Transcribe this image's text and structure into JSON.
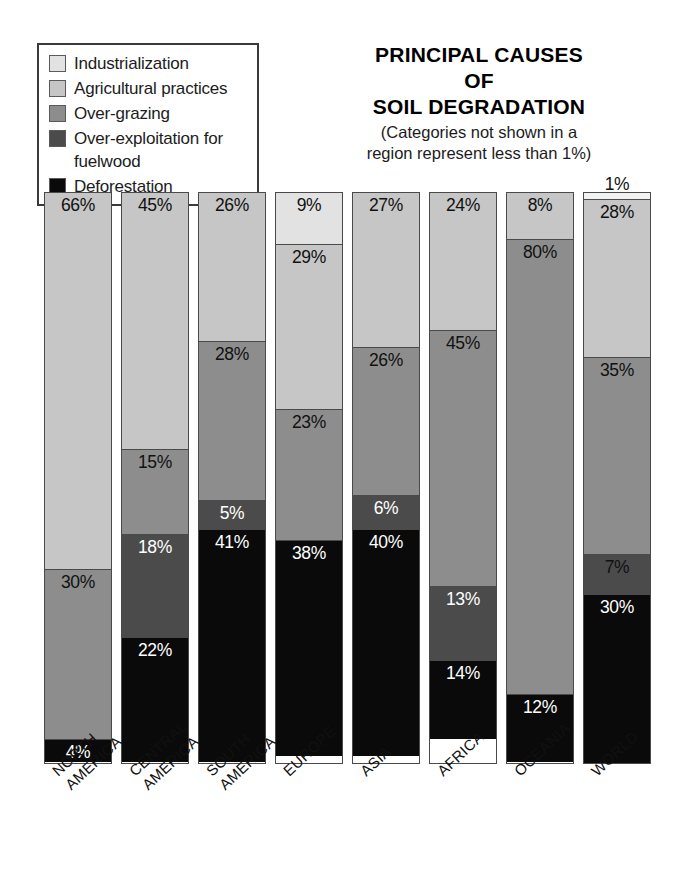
{
  "title": {
    "line1": "PRINCIPAL CAUSES",
    "line2": "OF",
    "line3": "SOIL DEGRADATION",
    "note_line1": "(Categories not shown in a",
    "note_line2": "region represent less than 1%)"
  },
  "legend": {
    "items": [
      {
        "label": "Industrialization",
        "color": "#e2e2e2"
      },
      {
        "label": "Agricultural practices",
        "color": "#c6c6c6"
      },
      {
        "label": "Over-grazing",
        "color": "#8d8d8d"
      },
      {
        "label": "Over-exploitation for\nfuelwood",
        "color": "#4b4b4b"
      },
      {
        "label": "Deforestation",
        "color": "#0a0a0a"
      }
    ]
  },
  "chart_data": {
    "type": "bar",
    "subtype": "stacked-100-percent",
    "title": "PRINCIPAL CAUSES OF SOIL DEGRADATION",
    "subtitle": "(Categories not shown in a region represent less than 1%)",
    "xlabel": "",
    "ylabel": "",
    "ylim": [
      0,
      100
    ],
    "unit": "%",
    "grid": false,
    "legend_position": "top-left",
    "categories": [
      "NORTH\nAMERICA",
      "CENTRAL\nAMERICA",
      "SOUTH\nAMERICA",
      "EUROPE",
      "ASIA",
      "AFRICA",
      "OCEANIA",
      "WORLD"
    ],
    "series": [
      {
        "name": "Industrialization",
        "color": "#e2e2e2",
        "values": [
          0,
          0,
          0,
          9,
          0,
          0,
          0,
          1
        ]
      },
      {
        "name": "Agricultural practices",
        "color": "#c6c6c6",
        "values": [
          66,
          45,
          26,
          29,
          27,
          24,
          8,
          28
        ]
      },
      {
        "name": "Over-grazing",
        "color": "#8d8d8d",
        "values": [
          30,
          15,
          28,
          23,
          26,
          45,
          80,
          35
        ]
      },
      {
        "name": "Over-exploitation for fuelwood",
        "color": "#4b4b4b",
        "values": [
          0,
          18,
          5,
          0,
          6,
          13,
          0,
          7
        ]
      },
      {
        "name": "Deforestation",
        "color": "#0a0a0a",
        "values": [
          4,
          22,
          41,
          38,
          40,
          14,
          12,
          30
        ]
      }
    ]
  },
  "bars": [
    {
      "region": "NORTH AMERICA",
      "label_line1": "NORTH",
      "label_line2": "AMERICA",
      "segments": [
        {
          "cause": "Agricultural practices",
          "value": 66,
          "text": "66%",
          "color": "#c6c6c6",
          "text_color": "dark"
        },
        {
          "cause": "Over-grazing",
          "value": 30,
          "text": "30%",
          "color": "#8d8d8d",
          "text_color": "dark"
        },
        {
          "cause": "Deforestation",
          "value": 4,
          "text": "4%",
          "color": "#0a0a0a",
          "text_color": "light"
        }
      ]
    },
    {
      "region": "CENTRAL AMERICA",
      "label_line1": "CENTRAL",
      "label_line2": "AMERICA",
      "segments": [
        {
          "cause": "Agricultural practices",
          "value": 45,
          "text": "45%",
          "color": "#c6c6c6",
          "text_color": "dark"
        },
        {
          "cause": "Over-grazing",
          "value": 15,
          "text": "15%",
          "color": "#8d8d8d",
          "text_color": "dark"
        },
        {
          "cause": "Over-exploitation for fuelwood",
          "value": 18,
          "text": "18%",
          "color": "#4b4b4b",
          "text_color": "light"
        },
        {
          "cause": "Deforestation",
          "value": 22,
          "text": "22%",
          "color": "#0a0a0a",
          "text_color": "light"
        }
      ]
    },
    {
      "region": "SOUTH AMERICA",
      "label_line1": "SOUTH",
      "label_line2": "AMERICA",
      "segments": [
        {
          "cause": "Agricultural practices",
          "value": 26,
          "text": "26%",
          "color": "#c6c6c6",
          "text_color": "dark"
        },
        {
          "cause": "Over-grazing",
          "value": 28,
          "text": "28%",
          "color": "#8d8d8d",
          "text_color": "dark"
        },
        {
          "cause": "Over-exploitation for fuelwood",
          "value": 5,
          "text": "5%",
          "color": "#4b4b4b",
          "text_color": "light"
        },
        {
          "cause": "Deforestation",
          "value": 41,
          "text": "41%",
          "color": "#0a0a0a",
          "text_color": "light"
        }
      ]
    },
    {
      "region": "EUROPE",
      "label_line1": "EUROPE",
      "label_line2": "",
      "segments": [
        {
          "cause": "Industrialization",
          "value": 9,
          "text": "9%",
          "color": "#e2e2e2",
          "text_color": "dark"
        },
        {
          "cause": "Agricultural practices",
          "value": 29,
          "text": "29%",
          "color": "#c6c6c6",
          "text_color": "dark"
        },
        {
          "cause": "Over-grazing",
          "value": 23,
          "text": "23%",
          "color": "#8d8d8d",
          "text_color": "dark"
        },
        {
          "cause": "Deforestation",
          "value": 38,
          "text": "38%",
          "color": "#0a0a0a",
          "text_color": "light"
        }
      ]
    },
    {
      "region": "ASIA",
      "label_line1": "ASIA",
      "label_line2": "",
      "segments": [
        {
          "cause": "Agricultural practices",
          "value": 27,
          "text": "27%",
          "color": "#c6c6c6",
          "text_color": "dark"
        },
        {
          "cause": "Over-grazing",
          "value": 26,
          "text": "26%",
          "color": "#8d8d8d",
          "text_color": "dark"
        },
        {
          "cause": "Over-exploitation for fuelwood",
          "value": 6,
          "text": "6%",
          "color": "#4b4b4b",
          "text_color": "light"
        },
        {
          "cause": "Deforestation",
          "value": 40,
          "text": "40%",
          "color": "#0a0a0a",
          "text_color": "light"
        }
      ]
    },
    {
      "region": "AFRICA",
      "label_line1": "AFRICA",
      "label_line2": "",
      "segments": [
        {
          "cause": "Agricultural practices",
          "value": 24,
          "text": "24%",
          "color": "#c6c6c6",
          "text_color": "dark"
        },
        {
          "cause": "Over-grazing",
          "value": 45,
          "text": "45%",
          "color": "#8d8d8d",
          "text_color": "dark"
        },
        {
          "cause": "Over-exploitation for fuelwood",
          "value": 13,
          "text": "13%",
          "color": "#4b4b4b",
          "text_color": "light"
        },
        {
          "cause": "Deforestation",
          "value": 14,
          "text": "14%",
          "color": "#0a0a0a",
          "text_color": "light"
        }
      ]
    },
    {
      "region": "OCEANIA",
      "label_line1": "OCEANIA",
      "label_line2": "",
      "segments": [
        {
          "cause": "Agricultural practices",
          "value": 8,
          "text": "8%",
          "color": "#c6c6c6",
          "text_color": "dark"
        },
        {
          "cause": "Over-grazing",
          "value": 80,
          "text": "80%",
          "color": "#8d8d8d",
          "text_color": "dark"
        },
        {
          "cause": "Deforestation",
          "value": 12,
          "text": "12%",
          "color": "#0a0a0a",
          "text_color": "light"
        }
      ]
    },
    {
      "region": "WORLD",
      "label_line1": "WORLD",
      "label_line2": "",
      "segments": [
        {
          "cause": "Industrialization",
          "value": 1,
          "text": "1%",
          "color": "#f2f2f2",
          "text_color": "dark",
          "label_outside": true
        },
        {
          "cause": "Agricultural practices",
          "value": 28,
          "text": "28%",
          "color": "#c6c6c6",
          "text_color": "dark"
        },
        {
          "cause": "Over-grazing",
          "value": 35,
          "text": "35%",
          "color": "#8d8d8d",
          "text_color": "dark"
        },
        {
          "cause": "Over-exploitation for fuelwood",
          "value": 7,
          "text": "7%",
          "color": "#4b4b4b",
          "text_color": "dark"
        },
        {
          "cause": "Deforestation",
          "value": 30,
          "text": "30%",
          "color": "#0a0a0a",
          "text_color": "light"
        }
      ]
    }
  ]
}
